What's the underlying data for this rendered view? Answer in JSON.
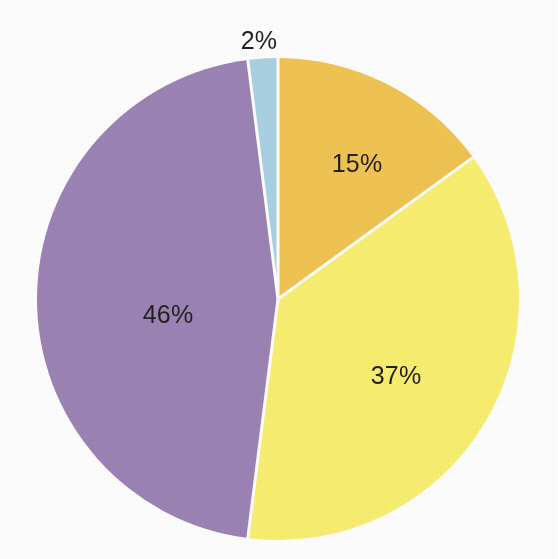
{
  "chart_data": {
    "type": "pie",
    "title": "",
    "subtitle": "",
    "xlabel": "",
    "ylabel": "",
    "legend_position": "none",
    "grid": false,
    "start_angle_deg": 0,
    "direction": "clockwise",
    "units": "percent",
    "total": 100,
    "categories": [
      "Amber slice",
      "Yellow slice",
      "Purple slice",
      "Light blue slice"
    ],
    "values": [
      15,
      37,
      46,
      2
    ],
    "labels": [
      "15%",
      "37%",
      "46%",
      "2%"
    ],
    "colors": [
      "#f3c452",
      "#faf06e",
      "#9c84b6",
      "#a9d3e3"
    ],
    "slices": [
      {
        "label": "15%",
        "value": 15,
        "color": "#f3c452",
        "start_deg": 0,
        "end_deg": 54,
        "label_x": 357,
        "label_y": 163,
        "label_inside": true
      },
      {
        "label": "37%",
        "value": 37,
        "color": "#faf06e",
        "start_deg": 54,
        "end_deg": 187.2,
        "label_x": 396,
        "label_y": 375,
        "label_inside": true
      },
      {
        "label": "46%",
        "value": 46,
        "color": "#9c84b6",
        "start_deg": 187.2,
        "end_deg": 352.8,
        "label_x": 168,
        "label_y": 314,
        "label_inside": true
      },
      {
        "label": "2%",
        "value": 2,
        "color": "#a9d3e3",
        "start_deg": 352.8,
        "end_deg": 360,
        "label_x": 259,
        "label_y": 40,
        "label_inside": false
      }
    ]
  },
  "geometry": {
    "center_x": 278,
    "center_y": 299,
    "radius": 241,
    "separator_color": "#ffffff",
    "separator_width": 3
  },
  "canvas": {
    "background": "#ffffff",
    "width": 558,
    "height": 559
  }
}
